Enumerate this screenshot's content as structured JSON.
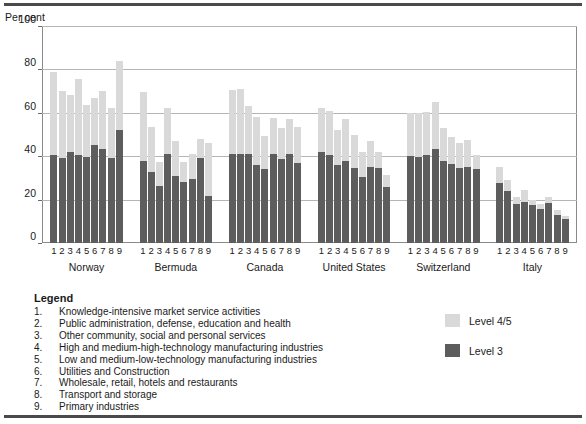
{
  "axis": {
    "y_title": "Per cent",
    "yticks": [
      "100",
      "80",
      "60",
      "40",
      "20",
      "0"
    ]
  },
  "legend": {
    "title": "Legend",
    "items": [
      {
        "num": "1.",
        "text": "Knowledge-intensive market service activities"
      },
      {
        "num": "2.",
        "text": "Public administration, defense, education and health"
      },
      {
        "num": "3.",
        "text": "Other community, social and personal services"
      },
      {
        "num": "4.",
        "text": "High and medium-high-technology manufacturing industries"
      },
      {
        "num": "5.",
        "text": "Low and medium-low-technology manufacturing industries"
      },
      {
        "num": "6.",
        "text": "Utilities and Construction"
      },
      {
        "num": "7.",
        "text": "Wholesale, retail, hotels and restaurants"
      },
      {
        "num": "8.",
        "text": "Transport and storage"
      },
      {
        "num": "9.",
        "text": "Primary industries"
      }
    ],
    "keys": [
      {
        "label": "Level 4/5",
        "color": "#d9d9d9"
      },
      {
        "label": "Level 3",
        "color": "#5d5d5d"
      }
    ]
  },
  "chart_data": {
    "type": "bar",
    "stacked": true,
    "title": "",
    "xlabel": "",
    "ylabel": "Per cent",
    "ylim": [
      0,
      100
    ],
    "yticks": [
      0,
      20,
      40,
      60,
      80,
      100
    ],
    "grid": true,
    "legend_position": "bottom-right",
    "categories": [
      "1",
      "2",
      "3",
      "4",
      "5",
      "6",
      "7",
      "8",
      "9"
    ],
    "groups": [
      {
        "name": "Norway",
        "series": [
          {
            "name": "Level 3",
            "values": [
              40.5,
              39.0,
              42.0,
              40.5,
              39.5,
              45.0,
              43.5,
              39.0,
              52.0
            ]
          },
          {
            "name": "Level 4/5",
            "values": [
              38.5,
              31.0,
              26.0,
              35.0,
              24.0,
              22.0,
              26.5,
              23.0,
              32.0
            ]
          }
        ],
        "totals": [
          79.0,
          70.0,
          68.0,
          75.5,
          63.5,
          67.0,
          70.0,
          62.0,
          84.0
        ]
      },
      {
        "name": "Bermuda",
        "series": [
          {
            "name": "Level 3",
            "values": [
              38.0,
              32.5,
              26.5,
              41.0,
              31.0,
              28.0,
              29.5,
              39.0,
              21.5
            ]
          },
          {
            "name": "Level 4/5",
            "values": [
              31.5,
              21.0,
              11.0,
              21.0,
              16.0,
              9.5,
              11.5,
              9.0,
              24.5
            ]
          }
        ],
        "totals": [
          69.5,
          53.5,
          37.5,
          62.0,
          47.0,
          37.5,
          41.0,
          48.0,
          46.0
        ]
      },
      {
        "name": "Canada",
        "series": [
          {
            "name": "Level 3",
            "values": [
              41.0,
              41.0,
              41.0,
              36.0,
              34.0,
              41.0,
              38.5,
              41.0,
              37.0
            ]
          },
          {
            "name": "Level 4/5",
            "values": [
              29.5,
              30.0,
              22.0,
              22.0,
              15.5,
              16.5,
              14.5,
              16.0,
              16.5
            ]
          }
        ],
        "totals": [
          70.5,
          71.0,
          63.0,
          58.0,
          49.5,
          57.5,
          53.0,
          57.0,
          53.5
        ]
      },
      {
        "name": "United States",
        "series": [
          {
            "name": "Level 3",
            "values": [
              42.0,
              40.5,
              36.0,
              38.0,
              34.5,
              30.5,
              35.0,
              34.5,
              26.0
            ]
          },
          {
            "name": "Level 4/5",
            "values": [
              20.0,
              20.5,
              16.0,
              19.0,
              15.5,
              11.5,
              12.0,
              7.5,
              5.5
            ]
          }
        ],
        "totals": [
          62.0,
          61.0,
          52.0,
          57.0,
          50.0,
          42.0,
          47.0,
          42.0,
          31.5
        ]
      },
      {
        "name": "Switzerland",
        "series": [
          {
            "name": "Level 3",
            "values": [
              40.0,
              39.5,
              40.5,
              43.5,
              38.0,
              36.5,
              34.5,
              35.0,
              34.0
            ]
          },
          {
            "name": "Level 4/5",
            "values": [
              20.0,
              20.5,
              20.0,
              21.5,
              15.0,
              12.5,
              11.5,
              12.5,
              6.5
            ]
          }
        ],
        "totals": [
          60.0,
          60.0,
          60.5,
          65.0,
          53.0,
          49.0,
          46.0,
          47.5,
          40.5
        ]
      },
      {
        "name": "Italy",
        "series": [
          {
            "name": "Level 3",
            "values": [
              27.5,
              24.0,
              18.0,
              19.0,
              17.5,
              15.5,
              18.5,
              13.0,
              11.0
            ]
          },
          {
            "name": "Level 4/5",
            "values": [
              7.5,
              5.0,
              3.0,
              5.5,
              2.5,
              2.5,
              2.5,
              2.0,
              1.5
            ]
          }
        ],
        "totals": [
          35.0,
          29.0,
          21.0,
          24.5,
          20.0,
          18.0,
          21.0,
          15.0,
          12.5
        ]
      }
    ]
  }
}
